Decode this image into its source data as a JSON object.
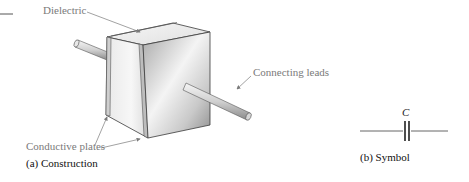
{
  "figure": {
    "labels": {
      "dielectric": "Dielectric",
      "connecting_leads": "Connecting leads",
      "conductive_plates": "Conductive plates",
      "symbol_letter": "C"
    },
    "captions": {
      "construction": "(a) Construction",
      "symbol": "(b) Symbol"
    },
    "colors": {
      "callout_text": "#7a7a7a",
      "caption_text": "#111111",
      "outline": "#3a3a3a",
      "face_light": "#f2f2f2",
      "face_mid": "#cfcfcf",
      "face_dark": "#9a9a9a",
      "lead": "#d8d8d8"
    }
  }
}
